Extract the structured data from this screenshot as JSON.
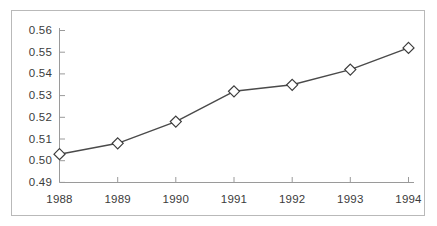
{
  "chart_data": {
    "type": "line",
    "title": "",
    "subtitle": "",
    "xlabel": "",
    "ylabel": "",
    "categories": [
      "1988",
      "1989",
      "1990",
      "1991",
      "1992",
      "1993",
      "1994"
    ],
    "x": [
      1988,
      1989,
      1990,
      1991,
      1992,
      1993,
      1994
    ],
    "values": [
      0.503,
      0.508,
      0.518,
      0.532,
      0.535,
      0.542,
      0.552
    ],
    "series": [
      {
        "name": "",
        "values": [
          0.503,
          0.508,
          0.518,
          0.532,
          0.535,
          0.542,
          0.552
        ]
      }
    ],
    "ylim": [
      0.49,
      0.56
    ],
    "xlim": [
      1988,
      1994
    ],
    "yticks": [
      0.49,
      0.5,
      0.51,
      0.52,
      0.53,
      0.54,
      0.55,
      0.56
    ],
    "ytick_labels": [
      "0.49",
      "0.50",
      "0.51",
      "0.52",
      "0.53",
      "0.54",
      "0.55",
      "0.56"
    ],
    "xtick_labels": [
      "1988",
      "1989",
      "1990",
      "1991",
      "1992",
      "1993",
      "1994"
    ],
    "grid": false,
    "legend": "none",
    "marker": "diamond-open",
    "line_color": "#4a4a4a",
    "marker_fill": "#ffffff",
    "marker_edge": "#3c3c3c",
    "axis_color": "#9a9a9a",
    "frame_color": "#b9b9b9",
    "background": "#ffffff",
    "annotations": []
  },
  "axis": {
    "y_labels": [
      "0.56",
      "0.55",
      "0.54",
      "0.53",
      "0.52",
      "0.51",
      "0.50",
      "0.49"
    ],
    "x_labels": [
      "1988",
      "1989",
      "1990",
      "1991",
      "1992",
      "1993",
      "1994"
    ]
  }
}
